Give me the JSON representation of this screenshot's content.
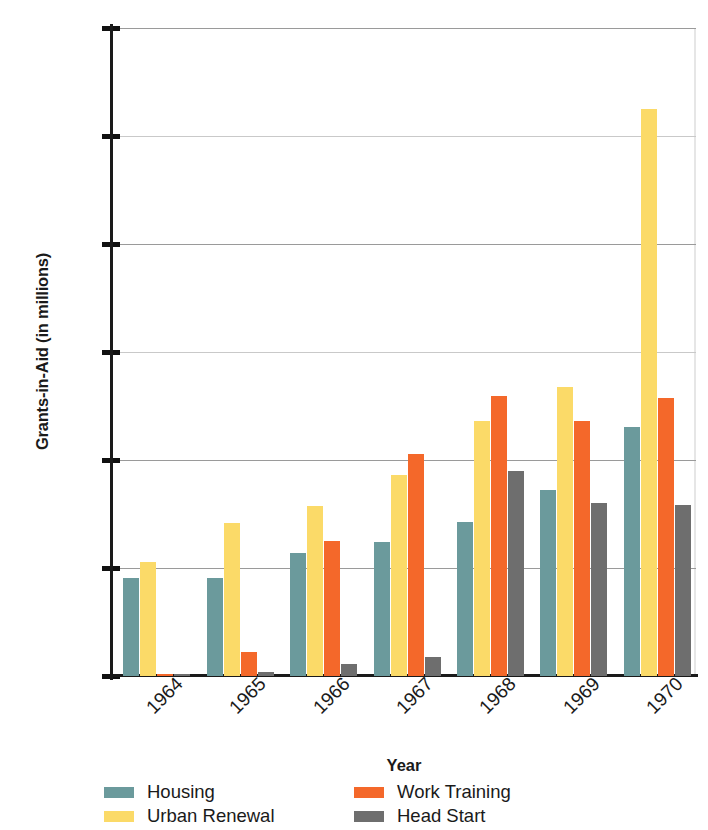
{
  "chart_data": {
    "type": "bar",
    "title": "",
    "xlabel": "Year",
    "ylabel": "Grants-in-Aid (in millions)",
    "categories": [
      "1964",
      "1965",
      "1966",
      "1967",
      "1968",
      "1969",
      "1970"
    ],
    "series": [
      {
        "name": "Housing",
        "color": "#6b9a9c",
        "values": [
          182,
          182,
          228,
          248,
          285,
          345,
          462
        ]
      },
      {
        "name": "Urban Renewal",
        "color": "#fbda68",
        "values": [
          212,
          283,
          315,
          373,
          473,
          535,
          1050
        ]
      },
      {
        "name": "Work Training",
        "color": "#f4682a",
        "values": [
          3,
          45,
          250,
          412,
          518,
          473,
          515
        ]
      },
      {
        "name": "Head Start",
        "color": "#6e6e6e",
        "values": [
          4,
          7,
          22,
          36,
          380,
          320,
          317
        ]
      }
    ],
    "ylim": [
      0,
      1200
    ],
    "ytick_labels": [
      "0",
      "200",
      "400",
      "600",
      "800",
      "1000",
      "1200"
    ],
    "ytick_values": [
      0,
      200,
      400,
      600,
      800,
      1000,
      1200
    ],
    "grid": true,
    "legend_position": "below"
  },
  "axes": {
    "y_title": "Grants-in-Aid (in millions)",
    "x_title": "Year"
  },
  "legend": {
    "entries": [
      {
        "label": "Housing",
        "color": "#6b9a9c",
        "icon": "legend-swatch-housing"
      },
      {
        "label": "Work Training",
        "color": "#f4682a",
        "icon": "legend-swatch-work-training"
      },
      {
        "label": "Urban Renewal",
        "color": "#fbda68",
        "icon": "legend-swatch-urban-renewal"
      },
      {
        "label": "Head Start",
        "color": "#6e6e6e",
        "icon": "legend-swatch-head-start"
      }
    ]
  }
}
